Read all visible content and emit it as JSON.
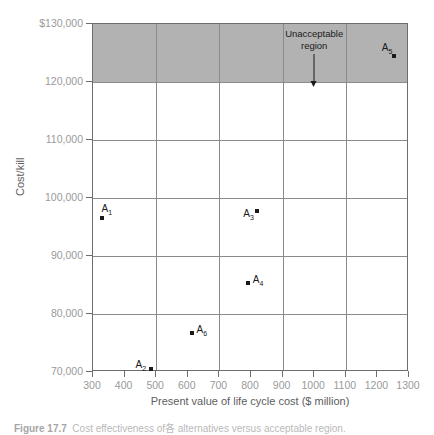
{
  "chart_data": {
    "type": "scatter",
    "title": "",
    "xlabel": "Present value of life cycle cost ($ million)",
    "ylabel": "Cost/kill",
    "xlim": [
      300,
      1300
    ],
    "ylim": [
      70000,
      130000
    ],
    "xticks": [
      300,
      400,
      500,
      600,
      700,
      800,
      900,
      1000,
      1100,
      1200,
      1300
    ],
    "xtick_labels": [
      "300",
      "400",
      "500",
      "600",
      "700",
      "800",
      "900",
      "1000",
      "1100",
      "1200",
      "1300"
    ],
    "yticks": [
      70000,
      80000,
      90000,
      100000,
      110000,
      120000,
      130000
    ],
    "ytick_labels": [
      "70,000",
      "80,000",
      "90,000",
      "100,000",
      "110,000",
      "120,000",
      "$130,000"
    ],
    "gridlines_x": [
      500,
      700,
      900,
      1100
    ],
    "gridlines_y": [
      80000,
      90000,
      100000,
      110000,
      120000
    ],
    "grid": true,
    "legend": "none",
    "points": [
      {
        "label": "A",
        "subscript": "1",
        "x": 330,
        "y": 96500,
        "label_pos": "above-right"
      },
      {
        "label": "A",
        "subscript": "2",
        "x": 485,
        "y": 70600,
        "label_pos": "left"
      },
      {
        "label": "A",
        "subscript": "3",
        "x": 820,
        "y": 97700,
        "label_pos": "below-left"
      },
      {
        "label": "A",
        "subscript": "4",
        "x": 790,
        "y": 85400,
        "label_pos": "right"
      },
      {
        "label": "A",
        "subscript": "5",
        "x": 1252,
        "y": 124400,
        "label_pos": "above-left"
      },
      {
        "label": "A",
        "subscript": "6",
        "x": 612,
        "y": 76800,
        "label_pos": "right"
      }
    ],
    "regions": [
      {
        "name": "unacceptable-region",
        "annotation_line1": "Unacceptable",
        "annotation_line2": "region",
        "y_from": 120000,
        "y_to": 130000,
        "color": "#b2b2b2"
      }
    ]
  },
  "caption": {
    "figure_number": "Figure 17.7",
    "text": "Cost effectiveness of各 alternatives versus acceptable region."
  }
}
